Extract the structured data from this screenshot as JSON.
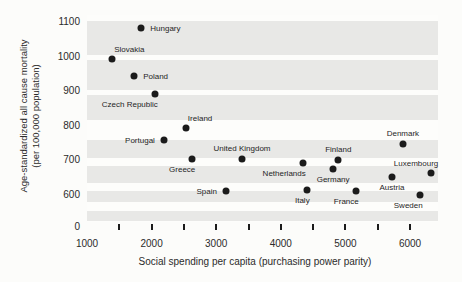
{
  "chart_data": {
    "type": "scatter",
    "xlabel": "Social spending per capita (purchasing power parity)",
    "ylabel_line1": "Age-standardized all cause mortality",
    "ylabel_line2": "(per 100,000 population)",
    "xlim": [
      1000,
      6450
    ],
    "ylim": [
      600,
      1100
    ],
    "y_axis_zero_label": "0",
    "x_ticks_labeled": [
      1000,
      2000,
      3000,
      4000,
      5000,
      6000
    ],
    "x_tick_marks": [
      1500,
      2000,
      2500,
      3000,
      3500,
      4000,
      4500,
      5000,
      5500,
      6000
    ],
    "y_ticks": [
      1100,
      1000,
      900,
      800,
      700,
      600
    ],
    "grid": "horizontal gray bands",
    "legend": "none",
    "points": [
      {
        "name": "Hungary",
        "x": 1840,
        "y": 1080,
        "label_pos": "right"
      },
      {
        "name": "Slovakia",
        "x": 1390,
        "y": 990,
        "label_pos": "above-right"
      },
      {
        "name": "Poland",
        "x": 1730,
        "y": 940,
        "label_pos": "right"
      },
      {
        "name": "Czech Republic",
        "x": 2050,
        "y": 890,
        "label_pos": "below-left"
      },
      {
        "name": "Ireland",
        "x": 2530,
        "y": 790,
        "label_pos": "above-right"
      },
      {
        "name": "Portugal",
        "x": 2190,
        "y": 755,
        "label_pos": "left"
      },
      {
        "name": "Greece",
        "x": 2630,
        "y": 700,
        "label_pos": "below-left"
      },
      {
        "name": "Spain",
        "x": 3150,
        "y": 610,
        "label_pos": "left"
      },
      {
        "name": "United Kingdom",
        "x": 3400,
        "y": 700,
        "label_pos": "above"
      },
      {
        "name": "Netherlands",
        "x": 4340,
        "y": 690,
        "label_pos": "below-left"
      },
      {
        "name": "Italy",
        "x": 4400,
        "y": 612,
        "label_pos": "below-left"
      },
      {
        "name": "Germany",
        "x": 4810,
        "y": 672,
        "label_pos": "below"
      },
      {
        "name": "Finland",
        "x": 4890,
        "y": 697,
        "label_pos": "above"
      },
      {
        "name": "France",
        "x": 5160,
        "y": 608,
        "label_pos": "below-left"
      },
      {
        "name": "Austria",
        "x": 5720,
        "y": 650,
        "label_pos": "below"
      },
      {
        "name": "Denmark",
        "x": 5890,
        "y": 745,
        "label_pos": "above"
      },
      {
        "name": "Sweden",
        "x": 6150,
        "y": 598,
        "label_pos": "below-left"
      },
      {
        "name": "Luxembourg",
        "x": 6330,
        "y": 660,
        "label_pos": "above-left"
      }
    ],
    "colors": {
      "dot": "#1b1b1b",
      "band": "#e8e8e6",
      "background": "#fcfcfa",
      "text": "#2b2b2b"
    }
  }
}
